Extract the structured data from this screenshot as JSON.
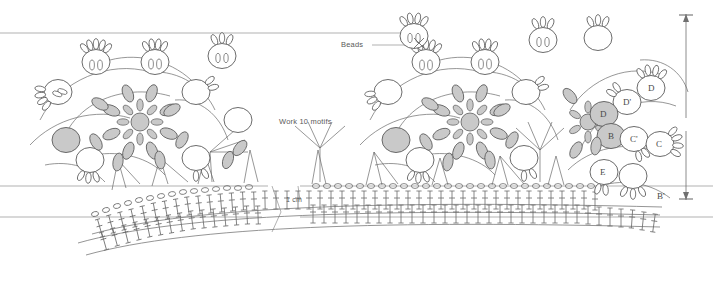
{
  "diagram": {
    "type": "tatting-crochet-pattern-schematic",
    "width": 713,
    "height": 293,
    "background": "#ffffff",
    "ink_color": "#555555",
    "fill_gray": "#c9c9c9",
    "fill_white": "#ffffff",
    "guide_color": "#8a8a8a"
  },
  "annotations": {
    "beads": "Beads",
    "motifs": "Work 10  motifs",
    "scale": "1 cm"
  },
  "point_labels": [
    {
      "id": "d-upper",
      "text": "D",
      "x": 651,
      "y": 88
    },
    {
      "id": "d-prime",
      "text": "D'",
      "x": 627,
      "y": 102
    },
    {
      "id": "d-inner",
      "text": "D",
      "x": 604,
      "y": 114
    },
    {
      "id": "b-inner",
      "text": "B",
      "x": 611,
      "y": 136
    },
    {
      "id": "c-prime",
      "text": "C'",
      "x": 634,
      "y": 139
    },
    {
      "id": "c-outer",
      "text": "C",
      "x": 659,
      "y": 144
    },
    {
      "id": "e-point",
      "text": "E",
      "x": 603,
      "y": 172
    },
    {
      "id": "b-prime",
      "text": "B'",
      "x": 660,
      "y": 196
    }
  ],
  "dimension_lines": [
    {
      "id": "right-upper",
      "x": 686,
      "y1": 14,
      "y2": 118,
      "caps": "both"
    },
    {
      "id": "right-lower",
      "x": 686,
      "y1": 131,
      "y2": 200,
      "caps": "both"
    }
  ],
  "guide_lines": [
    {
      "id": "beads-leader-top",
      "x1": 0,
      "y1": 33,
      "x2": 268,
      "y2": 33
    },
    {
      "id": "beads-leader-right",
      "x1": 268,
      "y1": 33,
      "x2": 400,
      "y2": 33
    },
    {
      "id": "beads-pointer",
      "x1": 372,
      "y1": 44,
      "x2": 412,
      "y2": 44
    },
    {
      "id": "mid-guide-left",
      "x1": 0,
      "y1": 186,
      "x2": 268,
      "y2": 186
    },
    {
      "id": "mid-guide-right",
      "x1": 300,
      "y1": 186,
      "x2": 713,
      "y2": 186
    },
    {
      "id": "lower-guide-left",
      "x1": 0,
      "y1": 216,
      "x2": 268,
      "y2": 216
    },
    {
      "id": "lower-guide-right",
      "x1": 300,
      "y1": 216,
      "x2": 713,
      "y2": 216
    }
  ],
  "motif_clusters": [
    {
      "id": "cluster-left",
      "cx": 140,
      "cy": 122,
      "radius": 52
    },
    {
      "id": "cluster-right",
      "cx": 470,
      "cy": 122,
      "radius": 52
    },
    {
      "id": "cluster-far-right",
      "cx": 615,
      "cy": 128,
      "radius": 42
    }
  ],
  "counts": {
    "motifs_in_repeat": 10,
    "scale_value_cm": 1
  }
}
